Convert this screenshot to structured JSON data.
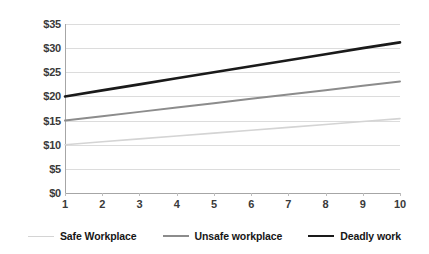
{
  "chart_data": {
    "type": "line",
    "title": "",
    "xlabel": "",
    "ylabel": "",
    "x": [
      1,
      2,
      3,
      4,
      5,
      6,
      7,
      8,
      9,
      10
    ],
    "xtick_labels": [
      "1",
      "2",
      "3",
      "4",
      "5",
      "6",
      "7",
      "8",
      "9",
      "10"
    ],
    "ytick_labels": [
      "$0",
      "$5",
      "$10",
      "$15",
      "$20",
      "$25",
      "$30",
      "$35"
    ],
    "ytick_values": [
      0,
      5,
      10,
      15,
      20,
      25,
      30,
      35
    ],
    "ylim": [
      0,
      35
    ],
    "xlim": [
      1,
      10
    ],
    "grid": "horizontal",
    "legend_position": "bottom",
    "series": [
      {
        "name": "Safe Workplace",
        "color": "#d4d4d4",
        "width": 1.6,
        "values": [
          10.0,
          10.6,
          11.2,
          11.8,
          12.4,
          13.0,
          13.6,
          14.2,
          14.8,
          15.4
        ]
      },
      {
        "name": "Unsafe workplace",
        "color": "#8c8c8c",
        "width": 2.0,
        "values": [
          15.0,
          15.9,
          16.8,
          17.7,
          18.6,
          19.5,
          20.4,
          21.3,
          22.2,
          23.1
        ]
      },
      {
        "name": "Deadly work",
        "color": "#1a1a1a",
        "width": 2.6,
        "values": [
          20.0,
          21.25,
          22.5,
          23.75,
          25.0,
          26.25,
          27.5,
          28.75,
          30.0,
          31.2
        ]
      }
    ]
  },
  "legend": {
    "items": [
      {
        "label": "Safe Workplace",
        "color": "#d4d4d4",
        "width": 1.6
      },
      {
        "label": "Unsafe workplace",
        "color": "#8c8c8c",
        "width": 2.0
      },
      {
        "label": "Deadly work",
        "color": "#1a1a1a",
        "width": 2.6
      }
    ]
  },
  "colors": {
    "background": "#ffffff",
    "gridline": "#dcdcdc",
    "axis": "#a6a6a6",
    "tick_text": "#3a3a3a",
    "legend_text": "#161616"
  }
}
